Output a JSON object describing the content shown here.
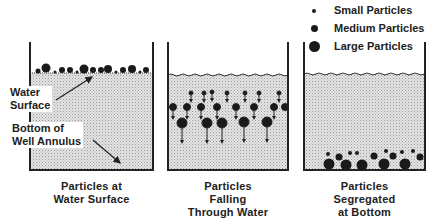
{
  "legend": {
    "items": [
      {
        "label": "Small Particles",
        "size": "small"
      },
      {
        "label": "Medium Particles",
        "size": "medium"
      },
      {
        "label": "Large Particles",
        "size": "large"
      }
    ]
  },
  "panels": [
    {
      "caption_line1": "Particles at",
      "caption_line2": "Water Surface",
      "caption_line3": ""
    },
    {
      "caption_line1": "Particles",
      "caption_line2": "Falling",
      "caption_line3": "Through Water"
    },
    {
      "caption_line1": "Particles",
      "caption_line2": "Segregated",
      "caption_line3": "at Bottom"
    }
  ],
  "callouts": {
    "water_surface_line1": "Water",
    "water_surface_line2": "Surface",
    "bottom_line1": "Bottom of",
    "bottom_line2": "Well Annulus"
  },
  "colors": {
    "water": "#d9d9d9",
    "particle": "#1a1a1a",
    "outline": "#222222"
  }
}
